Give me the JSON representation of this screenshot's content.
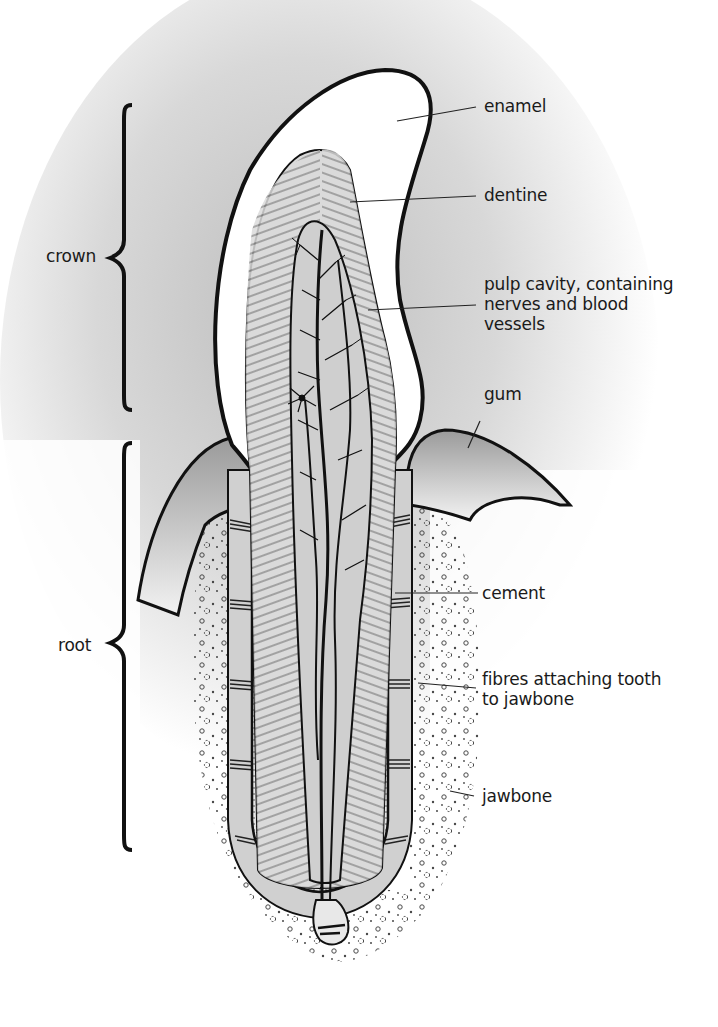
{
  "diagram": {
    "brackets": [
      {
        "id": "crown",
        "label": "crown"
      },
      {
        "id": "root",
        "label": "root"
      }
    ],
    "labels": {
      "enamel": "enamel",
      "dentine": "dentine",
      "pulp": "pulp cavity, containing\nnerves and blood\nvessels",
      "gum": "gum",
      "cement": "cement",
      "fibres": "fibres attaching tooth\nto jawbone",
      "jawbone": "jawbone"
    },
    "colors": {
      "ink": "#111111",
      "enamel": "#ffffff",
      "dentine": "#d6d6d6",
      "pulp": "#c8c8c8",
      "gum": "#b5b5b5",
      "background_shade": "#cfcfcf"
    }
  }
}
